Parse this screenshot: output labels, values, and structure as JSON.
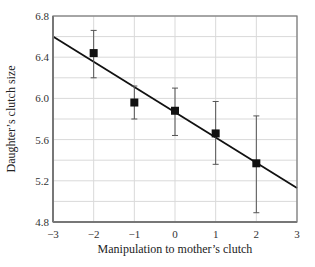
{
  "chart_data": {
    "type": "scatter",
    "title": "",
    "xlabel": "Manipulation to mother’s clutch",
    "ylabel": "Daughter’s clutch size",
    "xlim": [
      -3,
      3
    ],
    "ylim": [
      4.8,
      6.8
    ],
    "x_ticks": [
      -3,
      -2,
      -1,
      0,
      1,
      2,
      3
    ],
    "x_tick_labels": [
      "−3",
      "−2",
      "−1",
      "0",
      "1",
      "2",
      "3"
    ],
    "y_ticks": [
      4.8,
      5.2,
      5.6,
      6.0,
      6.4,
      6.8
    ],
    "y_tick_labels": [
      "4.8",
      "5.2",
      "5.6",
      "6.0",
      "6.4",
      "6.8"
    ],
    "y_minor_gridlines": [
      5.0,
      5.4,
      5.8,
      6.2,
      6.6
    ],
    "grid": true,
    "legend": null,
    "series": [
      {
        "name": "Mean daughter clutch size",
        "marker": "square",
        "x": [
          -2,
          -1,
          0,
          1,
          2
        ],
        "y": [
          6.44,
          5.96,
          5.88,
          5.66,
          5.37
        ],
        "error_upper": [
          6.66,
          6.12,
          6.1,
          5.97,
          5.83
        ],
        "error_lower": [
          6.2,
          5.8,
          5.64,
          5.36,
          4.89
        ]
      }
    ],
    "fit_line": {
      "x": [
        -3,
        3
      ],
      "y": [
        6.6,
        5.13
      ]
    }
  },
  "colors": {
    "grid": "#d9d9d9",
    "axis": "#777777",
    "marker": "#111111",
    "line": "#111111",
    "errorbar": "#555555"
  }
}
